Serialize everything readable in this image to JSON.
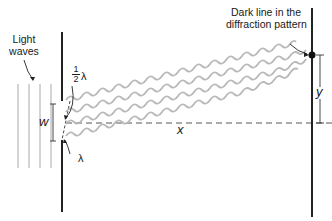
{
  "diagram": {
    "labels": {
      "light_waves_line1": "Light",
      "light_waves_line2": "waves",
      "dark_line_line1": "Dark line in the",
      "dark_line_line2": "diffraction pattern",
      "half_num": "1",
      "half_den": "2",
      "half_lambda": "λ",
      "lambda": "λ",
      "w": "w",
      "x": "x",
      "y": "y"
    },
    "colors": {
      "barrier": "#222222",
      "wave": "#b5b5b5",
      "incident_wave": "#9a9a9a",
      "dashed": "#444444",
      "dot": "#111111"
    }
  }
}
